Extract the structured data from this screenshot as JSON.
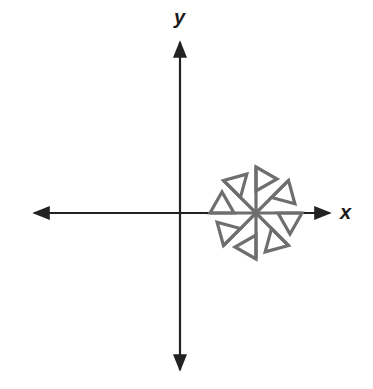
{
  "diagram": {
    "type": "coordinate-plane-with-figure",
    "axes": {
      "x_label": "x",
      "y_label": "y",
      "origin_px": [
        180,
        213
      ],
      "color": "#222222"
    },
    "figure": {
      "name": "pinwheel",
      "description": "Eight spokes at 45-degree intervals radiating from a center on the positive x-axis, each spoke ending in a triangular flag; the figure has 8-fold rotational symmetry",
      "center_px": [
        256,
        213
      ],
      "spoke_count": 8,
      "spoke_length_px": 46,
      "rotation_step_degrees": 45,
      "color": "#6e6e6e"
    }
  }
}
